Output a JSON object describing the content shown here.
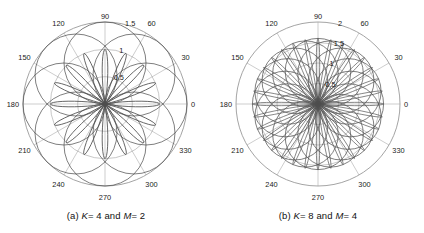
{
  "figure": {
    "background_color": "#ffffff",
    "grid_color": "#9a9a9a",
    "curve_color": "#4d4d4d",
    "text_color": "#1a1a1a",
    "panel_count": 2
  },
  "panels": [
    {
      "id": "panel-a",
      "caption_prefix": "(a)",
      "caption_k": "K",
      "caption_k_value": "= 4",
      "caption_and": "and",
      "caption_m": "M",
      "caption_m_value": "= 2",
      "caption_full": "(a) K= 4 and M= 2",
      "K": 4,
      "M": 2,
      "center_x": 105,
      "center_y": 104,
      "outer_radius": 82,
      "angle_labels": [
        "0",
        "30",
        "60",
        "90",
        "120",
        "150",
        "180",
        "210",
        "240",
        "270",
        "300",
        "330"
      ],
      "angle_values": [
        0,
        30,
        60,
        90,
        120,
        150,
        180,
        210,
        240,
        270,
        300,
        330
      ],
      "radial_labels": [
        "0.5",
        "1",
        "1.5"
      ],
      "radial_values": [
        0.5,
        1,
        1.5
      ],
      "r_max": 1.5,
      "lobe_count": 16,
      "lobe_peak_r": 1.0,
      "ring_radii_r": [
        0.5,
        1.0,
        1.5
      ]
    },
    {
      "id": "panel-b",
      "caption_prefix": "(b)",
      "caption_k": "K",
      "caption_k_value": "= 8",
      "caption_and": "and",
      "caption_m": "M",
      "caption_m_value": "= 4",
      "caption_full": "(b) K= 8 and M= 4",
      "K": 8,
      "M": 4,
      "center_x": 106,
      "center_y": 104,
      "outer_radius": 82,
      "angle_labels": [
        "0",
        "30",
        "60",
        "90",
        "120",
        "150",
        "180",
        "210",
        "240",
        "270",
        "300",
        "330"
      ],
      "angle_values": [
        0,
        30,
        60,
        90,
        120,
        150,
        180,
        210,
        240,
        270,
        300,
        330
      ],
      "radial_labels": [
        "0.5",
        "1",
        "1.5",
        "2"
      ],
      "radial_values": [
        0.5,
        1,
        1.5,
        2
      ],
      "r_max": 2.0,
      "lobe_count": 32,
      "lobe_peak_r": 1.6,
      "ring_radii_r": [
        0.5,
        1.0,
        1.5,
        2.0
      ]
    }
  ],
  "chart_data": {
    "type": "line",
    "subtype": "polar-rose",
    "title": "",
    "charts": [
      {
        "name": "panel-a",
        "title": "(a) K= 4 and M= 2",
        "K": 4,
        "M": 2,
        "theta_label": "angle (degrees)",
        "r_label": "magnitude",
        "theta_ticks": [
          0,
          30,
          60,
          90,
          120,
          150,
          180,
          210,
          240,
          270,
          300,
          330
        ],
        "theta_tick_labels": [
          "0",
          "30",
          "60",
          "90",
          "120",
          "150",
          "180",
          "210",
          "240",
          "270",
          "300",
          "330"
        ],
        "r_ticks": [
          0.5,
          1,
          1.5
        ],
        "r_tick_labels": [
          "0.5",
          "1",
          "1.5"
        ],
        "rlim": [
          0,
          1.5
        ],
        "grid": true,
        "legend": "none",
        "series": [
          {
            "name": "rose-lobes",
            "description": "16 symmetric lobes radiating from origin, peak magnitude 1.0",
            "lobe_count": 16,
            "peak_r": 1.0,
            "lobe_peak_angles": [
              0,
              22.5,
              45,
              67.5,
              90,
              112.5,
              135,
              157.5,
              180,
              202.5,
              225,
              247.5,
              270,
              292.5,
              315,
              337.5
            ],
            "lobe_peak_values": [
              1.0,
              1.0,
              1.0,
              1.0,
              1.0,
              1.0,
              1.0,
              1.0,
              1.0,
              1.0,
              1.0,
              1.0,
              1.0,
              1.0,
              1.0,
              1.0
            ]
          },
          {
            "name": "envelope-circles",
            "description": "8 overlapping circles of radius 0.75 centered at r=0.75 forming rosette envelope",
            "circle_count": 8,
            "circle_radius_r": 0.75,
            "circle_center_r": 0.75,
            "circle_center_angles": [
              0,
              45,
              90,
              135,
              180,
              225,
              270,
              315
            ]
          }
        ]
      },
      {
        "name": "panel-b",
        "title": "(b) K= 8 and M= 4",
        "K": 8,
        "M": 4,
        "theta_label": "angle (degrees)",
        "r_label": "magnitude",
        "theta_ticks": [
          0,
          30,
          60,
          90,
          120,
          150,
          180,
          210,
          240,
          270,
          300,
          330
        ],
        "theta_tick_labels": [
          "0",
          "30",
          "60",
          "90",
          "120",
          "150",
          "180",
          "210",
          "240",
          "270",
          "300",
          "330"
        ],
        "r_ticks": [
          0.5,
          1,
          1.5,
          2
        ],
        "r_tick_labels": [
          "0.5",
          "1",
          "1.5",
          "2"
        ],
        "rlim": [
          0,
          2.0
        ],
        "grid": true,
        "legend": "none",
        "series": [
          {
            "name": "rose-lobes",
            "description": "32 narrow symmetric lobes radiating from origin, peak magnitude 1.6",
            "lobe_count": 32,
            "peak_r": 1.6,
            "lobe_peak_angles": [
              0,
              11.25,
              22.5,
              33.75,
              45,
              56.25,
              67.5,
              78.75,
              90,
              101.25,
              112.5,
              123.75,
              135,
              146.25,
              157.5,
              168.75,
              180,
              191.25,
              202.5,
              213.75,
              225,
              236.25,
              247.5,
              258.75,
              270,
              281.25,
              292.5,
              303.75,
              315,
              326.25,
              337.5,
              348.75
            ],
            "lobe_peak_values": [
              1.6,
              1.6,
              1.6,
              1.6,
              1.6,
              1.6,
              1.6,
              1.6,
              1.6,
              1.6,
              1.6,
              1.6,
              1.6,
              1.6,
              1.6,
              1.6,
              1.6,
              1.6,
              1.6,
              1.6,
              1.6,
              1.6,
              1.6,
              1.6,
              1.6,
              1.6,
              1.6,
              1.6,
              1.6,
              1.6,
              1.6,
              1.6
            ]
          },
          {
            "name": "envelope-circles",
            "description": "16 overlapping circles of radius 0.8 centered at r=0.8 forming dense rosette envelope",
            "circle_count": 16,
            "circle_radius_r": 0.8,
            "circle_center_r": 0.8,
            "circle_center_angles": [
              0,
              22.5,
              45,
              67.5,
              90,
              112.5,
              135,
              157.5,
              180,
              202.5,
              225,
              247.5,
              270,
              292.5,
              315,
              337.5
            ]
          }
        ]
      }
    ]
  }
}
